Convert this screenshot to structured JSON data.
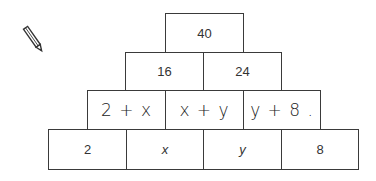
{
  "pencil_icon": "pencil",
  "pyramid": {
    "row1": [
      "40"
    ],
    "row2": [
      "16",
      "24"
    ],
    "row3": [
      "2 + x",
      "x + y",
      "y + 8 ."
    ],
    "row4": [
      "2",
      "x",
      "y",
      "8"
    ]
  }
}
